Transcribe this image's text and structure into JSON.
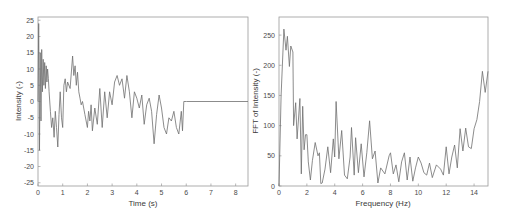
{
  "chart_data": [
    {
      "type": "line",
      "title": "",
      "xlabel": "Time (s)",
      "ylabel": "Intensity (-)",
      "xlim": [
        0,
        8.5
      ],
      "ylim": [
        -26,
        26
      ],
      "xticks": [
        0,
        1,
        2,
        3,
        4,
        5,
        6,
        7,
        8
      ],
      "yticks": [
        -25,
        -20,
        -15,
        -10,
        -5,
        0,
        5,
        10,
        15,
        20,
        25
      ],
      "grid": false,
      "line_color": "#777777",
      "x": [
        0,
        0.03,
        0.06,
        0.09,
        0.12,
        0.15,
        0.18,
        0.21,
        0.24,
        0.27,
        0.3,
        0.33,
        0.36,
        0.39,
        0.42,
        0.45,
        0.5,
        0.55,
        0.6,
        0.65,
        0.7,
        0.75,
        0.8,
        0.85,
        0.9,
        0.95,
        1.0,
        1.05,
        1.1,
        1.15,
        1.2,
        1.3,
        1.4,
        1.45,
        1.5,
        1.55,
        1.6,
        1.65,
        1.7,
        1.75,
        1.8,
        1.9,
        2.0,
        2.05,
        2.1,
        2.15,
        2.2,
        2.3,
        2.4,
        2.5,
        2.6,
        2.7,
        2.8,
        2.9,
        3.0,
        3.1,
        3.2,
        3.3,
        3.4,
        3.5,
        3.6,
        3.7,
        3.8,
        3.9,
        4.0,
        4.1,
        4.2,
        4.3,
        4.4,
        4.5,
        4.6,
        4.7,
        4.8,
        4.9,
        5.0,
        5.1,
        5.2,
        5.3,
        5.4,
        5.5,
        5.6,
        5.7,
        5.8,
        5.85,
        5.9,
        5.95,
        6.0,
        6.01,
        8.5
      ],
      "y": [
        0,
        24,
        -15,
        15,
        -6,
        16,
        3,
        13,
        5,
        12,
        4,
        11,
        6,
        10,
        7,
        3,
        -3,
        -8,
        -5,
        -11,
        -3,
        -8,
        -14,
        -4,
        3,
        -5,
        -8,
        5,
        7,
        3,
        6,
        4,
        14,
        8,
        11,
        5,
        9,
        3,
        1,
        -1,
        0,
        -4,
        -8,
        -3,
        -6,
        -1,
        -9,
        -2,
        -7,
        4,
        -8,
        3,
        -5,
        3,
        -1,
        6,
        8,
        5,
        7,
        1,
        8,
        3,
        -5,
        3,
        1,
        -2,
        2,
        -7,
        -1,
        1,
        -3,
        -13,
        -4,
        2,
        -2,
        -8,
        -10,
        -5,
        -6,
        -3,
        -8,
        -10,
        -3,
        -9,
        0,
        0,
        0,
        0,
        0
      ]
    },
    {
      "type": "line",
      "title": "",
      "xlabel": "Frequency (Hz)",
      "ylabel": "FFT of Intensity (-)",
      "xlim": [
        0,
        15
      ],
      "ylim": [
        0,
        280
      ],
      "xticks": [
        0,
        2,
        4,
        6,
        8,
        10,
        12,
        14
      ],
      "yticks": [
        0,
        50,
        100,
        150,
        200,
        250
      ],
      "grid": false,
      "line_color": "#777777",
      "x": [
        0,
        0.15,
        0.35,
        0.5,
        0.6,
        0.75,
        0.85,
        1.0,
        1.05,
        1.2,
        1.3,
        1.5,
        1.6,
        1.7,
        1.8,
        1.9,
        2.0,
        2.1,
        2.25,
        2.4,
        2.6,
        2.8,
        2.9,
        3.0,
        3.1,
        3.3,
        3.5,
        3.7,
        3.9,
        4.0,
        4.1,
        4.3,
        4.5,
        4.7,
        4.9,
        5.1,
        5.2,
        5.4,
        5.5,
        5.7,
        5.9,
        6.1,
        6.3,
        6.5,
        6.7,
        6.9,
        7.1,
        7.3,
        7.6,
        7.9,
        8.0,
        8.2,
        8.4,
        8.6,
        8.8,
        9.0,
        9.2,
        9.4,
        9.6,
        9.8,
        10.0,
        10.2,
        10.4,
        10.6,
        10.8,
        11.0,
        11.3,
        11.6,
        11.8,
        12.0,
        12.2,
        12.4,
        12.6,
        12.8,
        13.0,
        13.2,
        13.4,
        13.6,
        13.8,
        14.0,
        14.2,
        14.4,
        14.6,
        14.8,
        15.0
      ],
      "y": [
        0,
        150,
        260,
        225,
        248,
        198,
        232,
        222,
        100,
        138,
        78,
        145,
        20,
        132,
        60,
        85,
        85,
        40,
        10,
        42,
        72,
        50,
        55,
        4,
        5,
        28,
        65,
        22,
        78,
        48,
        140,
        45,
        92,
        18,
        12,
        48,
        97,
        18,
        80,
        22,
        70,
        15,
        55,
        108,
        45,
        58,
        5,
        30,
        20,
        50,
        55,
        20,
        35,
        7,
        40,
        55,
        10,
        48,
        8,
        30,
        48,
        38,
        22,
        18,
        38,
        14,
        35,
        28,
        18,
        65,
        20,
        48,
        68,
        30,
        95,
        58,
        96,
        65,
        62,
        95,
        110,
        140,
        190,
        155,
        190
      ]
    }
  ],
  "plots": {
    "left": {
      "xlabel": "Time (s)",
      "ylabel": "Intensity (-)",
      "xticks": [
        "0",
        "1",
        "2",
        "3",
        "4",
        "5",
        "6",
        "7",
        "8"
      ],
      "yticks": [
        "25",
        "20",
        "15",
        "10",
        "5",
        "0",
        "-5",
        "-10",
        "-15",
        "-20",
        "-25"
      ]
    },
    "right": {
      "xlabel": "Frequency (Hz)",
      "ylabel": "FFT of Intensity (-)",
      "xticks": [
        "0",
        "2",
        "4",
        "6",
        "8",
        "10",
        "12",
        "14"
      ],
      "yticks": [
        "250",
        "200",
        "150",
        "100",
        "50",
        "0"
      ]
    }
  }
}
